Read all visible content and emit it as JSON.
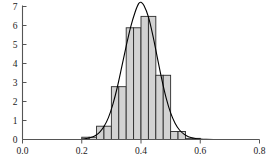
{
  "chart_data": {
    "type": "bar",
    "title": "",
    "subtitle": "",
    "xlabel": "",
    "ylabel": "",
    "xlim": [
      0.0,
      0.8
    ],
    "ylim": [
      0,
      7
    ],
    "grid": false,
    "legend": null,
    "bin_width": 0.025,
    "bar_fill": "#d2d2d2",
    "bar_edge": "#2b2b2b",
    "curve_color": "#000000",
    "axis_color": "#555555",
    "xticks": [
      0.0,
      0.2,
      0.4,
      0.6,
      0.8
    ],
    "xtick_labels": [
      "0.0",
      "0.2",
      "0.4",
      "0.6",
      "0.8"
    ],
    "yticks": [
      0,
      1,
      2,
      3,
      4,
      5,
      6,
      7
    ],
    "ytick_labels": [
      "0",
      "1",
      "2",
      "3",
      "4",
      "5",
      "6",
      "7"
    ],
    "bars": [
      {
        "x0": 0.2,
        "x1": 0.225,
        "height": 0.12
      },
      {
        "x0": 0.225,
        "x1": 0.25,
        "height": 0.12
      },
      {
        "x0": 0.25,
        "x1": 0.275,
        "height": 0.7
      },
      {
        "x0": 0.275,
        "x1": 0.3,
        "height": 0.7
      },
      {
        "x0": 0.3,
        "x1": 0.325,
        "height": 2.78
      },
      {
        "x0": 0.325,
        "x1": 0.35,
        "height": 2.78
      },
      {
        "x0": 0.35,
        "x1": 0.375,
        "height": 5.88
      },
      {
        "x0": 0.375,
        "x1": 0.4,
        "height": 5.88
      },
      {
        "x0": 0.4,
        "x1": 0.425,
        "height": 6.48
      },
      {
        "x0": 0.425,
        "x1": 0.45,
        "height": 6.48
      },
      {
        "x0": 0.45,
        "x1": 0.475,
        "height": 3.38
      },
      {
        "x0": 0.475,
        "x1": 0.5,
        "height": 3.38
      },
      {
        "x0": 0.5,
        "x1": 0.525,
        "height": 0.42
      },
      {
        "x0": 0.525,
        "x1": 0.55,
        "height": 0.42
      },
      {
        "x0": 0.55,
        "x1": 0.575,
        "height": 0.06
      },
      {
        "x0": 0.575,
        "x1": 0.6,
        "height": 0.06
      }
    ],
    "curve": {
      "name": "fitted-normal-density",
      "mean": 0.398,
      "peak_value": 7.22,
      "points": [
        [
          0.2,
          0.02
        ],
        [
          0.215,
          0.05
        ],
        [
          0.23,
          0.1
        ],
        [
          0.245,
          0.2
        ],
        [
          0.26,
          0.38
        ],
        [
          0.275,
          0.68
        ],
        [
          0.29,
          1.15
        ],
        [
          0.305,
          1.85
        ],
        [
          0.32,
          2.75
        ],
        [
          0.335,
          3.82
        ],
        [
          0.35,
          4.92
        ],
        [
          0.365,
          5.92
        ],
        [
          0.38,
          6.7
        ],
        [
          0.392,
          7.15
        ],
        [
          0.4,
          7.22
        ],
        [
          0.41,
          7.05
        ],
        [
          0.425,
          6.45
        ],
        [
          0.44,
          5.48
        ],
        [
          0.455,
          4.32
        ],
        [
          0.47,
          3.18
        ],
        [
          0.485,
          2.18
        ],
        [
          0.5,
          1.4
        ],
        [
          0.515,
          0.86
        ],
        [
          0.53,
          0.5
        ],
        [
          0.545,
          0.28
        ],
        [
          0.56,
          0.15
        ],
        [
          0.58,
          0.07
        ],
        [
          0.6,
          0.03
        ],
        [
          0.62,
          0.01
        ],
        [
          0.65,
          0.0
        ]
      ]
    }
  },
  "caption": {
    "text": ""
  }
}
